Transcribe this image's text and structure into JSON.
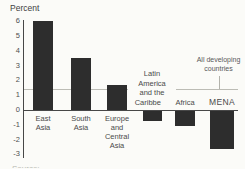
{
  "chart_data": {
    "type": "bar",
    "title": "",
    "ylabel": "Percent",
    "xlabel": "",
    "categories": [
      "East Asia",
      "South Asia",
      "Europe and Central Asia",
      "Latin America and the Caribbean",
      "Africa",
      "MENA"
    ],
    "values": [
      6.0,
      3.5,
      1.7,
      -0.7,
      -1.0,
      -2.6
    ],
    "category_label_lines": [
      [
        "East",
        "Asia"
      ],
      [
        "South",
        "Asia"
      ],
      [
        "Europe",
        "and",
        "Central",
        "Asia"
      ],
      [
        "Latin",
        "America",
        "and the",
        "Caribbean"
      ],
      [
        "Africa"
      ],
      [
        "MENA"
      ]
    ],
    "yticks": [
      6,
      5,
      4,
      3,
      2,
      1,
      0,
      -1,
      -2,
      -3
    ],
    "ylim": [
      -3,
      6
    ],
    "grid": false,
    "legend": "none",
    "reference_line": {
      "value": 1.4,
      "label": "All developing countries",
      "label_lines": [
        "All developing",
        "countries"
      ]
    },
    "bar_color": "#2d2d2d"
  },
  "footnote_partial": "Source:",
  "colors": {
    "background": "#fbfbf8",
    "text": "#4a4a4a",
    "axis": "#474747",
    "reference_line": "#bcbcb5",
    "bar": "#2d2d2d"
  }
}
